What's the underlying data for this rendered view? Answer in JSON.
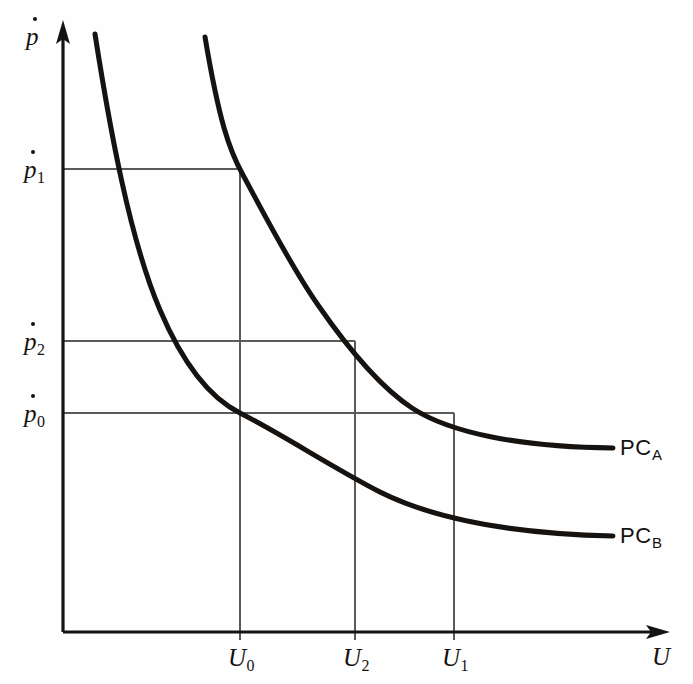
{
  "figure": {
    "type": "diagram",
    "background_color": "#fefefe",
    "ink_color": "#16120f",
    "grid_color": "#5a5a5a"
  },
  "axes": {
    "y_axis_label": "p",
    "y_axis_label_has_overdot": "yes",
    "x_axis_label": "U",
    "origin_x": 63,
    "origin_y": 632,
    "x_arrow_tip_x": 668,
    "y_arrow_tip_y": 22
  },
  "y_ticks": [
    {
      "id": "p1",
      "base": "p",
      "sub": "1",
      "y": 169
    },
    {
      "id": "p2",
      "base": "p",
      "sub": "2",
      "y": 341
    },
    {
      "id": "p0",
      "base": "p",
      "sub": "0",
      "y": 413
    }
  ],
  "x_ticks": [
    {
      "id": "U0",
      "base": "U",
      "sub": "0",
      "x": 240
    },
    {
      "id": "U2",
      "base": "U",
      "sub": "2",
      "x": 355
    },
    {
      "id": "U1",
      "base": "U",
      "sub": "1",
      "x": 454
    }
  ],
  "curves": [
    {
      "id": "PCA",
      "base": "PC",
      "sub": "A",
      "label_x": 620,
      "label_y": 437,
      "path": "M 205,37 C 219,120 229,150 243,175 C 262,210 290,265 318,305 C 345,344 380,387 412,408 C 450,433 520,447 613,448",
      "points": [
        {
          "x": 240,
          "y": 169,
          "meaning": "p1 at U0"
        },
        {
          "x": 355,
          "y": 341,
          "meaning": "p2 at U2"
        },
        {
          "x": 454,
          "y": 413,
          "meaning": "p0 at U1"
        }
      ]
    },
    {
      "id": "PCB",
      "base": "PC",
      "sub": "B",
      "label_x": 620,
      "label_y": 525,
      "path": "M 95,34 C 110,130 130,240 160,310 C 186,371 214,400 240,413 C 285,436 330,466 380,492 C 440,522 520,534 613,536",
      "points": [
        {
          "x": 240,
          "y": 413,
          "meaning": "p0 at U0"
        }
      ]
    }
  ],
  "guide_lines": {
    "horizontal": [
      {
        "id": "h-p1",
        "y": 169,
        "from_x": 63,
        "to_x": 240
      },
      {
        "id": "h-p2",
        "y": 341,
        "from_x": 63,
        "to_x": 355
      },
      {
        "id": "h-p0",
        "y": 413,
        "from_x": 63,
        "to_x": 454
      }
    ],
    "vertical": [
      {
        "id": "v-U0",
        "x": 240,
        "from_y": 169,
        "to_y": 632
      },
      {
        "id": "v-U2",
        "x": 355,
        "from_y": 341,
        "to_y": 632
      },
      {
        "id": "v-U1",
        "x": 454,
        "from_y": 413,
        "to_y": 632
      }
    ]
  }
}
